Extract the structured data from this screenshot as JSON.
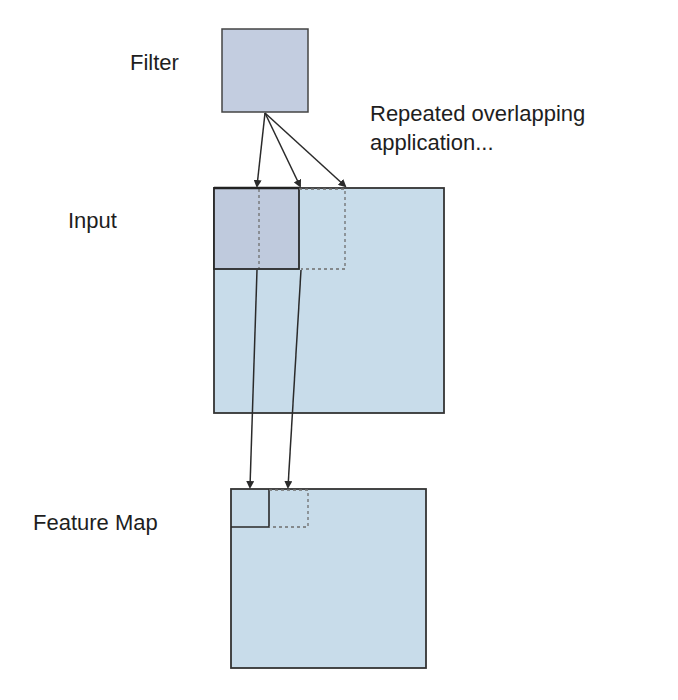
{
  "diagram": {
    "labels": {
      "filter": "Filter",
      "input": "Input",
      "feature_map": "Feature Map",
      "repeated_application": "Repeated overlapping application..."
    },
    "colors": {
      "filter_fill": "#c3cde0",
      "input_fill": "#c8dcea",
      "receptive_field_fill": "#bfcadd",
      "feature_map_fill": "#c8dcea",
      "stroke": "#333333",
      "dashed_stroke": "#6e6e6e"
    },
    "nodes": [
      {
        "id": "filter",
        "label": "Filter"
      },
      {
        "id": "input",
        "label": "Input"
      },
      {
        "id": "feature_map",
        "label": "Feature Map"
      }
    ],
    "edges": [
      {
        "from": "filter",
        "to": "input",
        "note": "position 1"
      },
      {
        "from": "filter",
        "to": "input",
        "note": "position 2 (overlapping)"
      },
      {
        "from": "filter",
        "to": "input",
        "note": "position 3 (overlapping)"
      },
      {
        "from": "input",
        "to": "feature_map",
        "note": "position 1 output"
      },
      {
        "from": "input",
        "to": "feature_map",
        "note": "position 2 output"
      }
    ]
  }
}
